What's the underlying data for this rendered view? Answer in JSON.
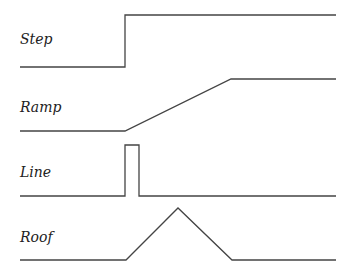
{
  "diagram": {
    "edges": [
      {
        "label": "Step",
        "label_pos": [
          20,
          44
        ],
        "points": [
          [
            20,
            67
          ],
          [
            125,
            67
          ],
          [
            125,
            15
          ],
          [
            336,
            15
          ]
        ]
      },
      {
        "label": "Ramp",
        "label_pos": [
          20,
          112
        ],
        "points": [
          [
            20,
            131
          ],
          [
            125,
            131
          ],
          [
            231,
            79
          ],
          [
            336,
            79
          ]
        ]
      },
      {
        "label": "Line",
        "label_pos": [
          20,
          177
        ],
        "points": [
          [
            20,
            196
          ],
          [
            125,
            196
          ],
          [
            125,
            145
          ],
          [
            139,
            145
          ],
          [
            139,
            196
          ],
          [
            336,
            196
          ]
        ]
      },
      {
        "label": "Roof",
        "label_pos": [
          20,
          242
        ],
        "points": [
          [
            20,
            260
          ],
          [
            126,
            260
          ],
          [
            178,
            208
          ],
          [
            232,
            260
          ],
          [
            336,
            260
          ]
        ]
      }
    ],
    "stroke_color": "#444444"
  }
}
